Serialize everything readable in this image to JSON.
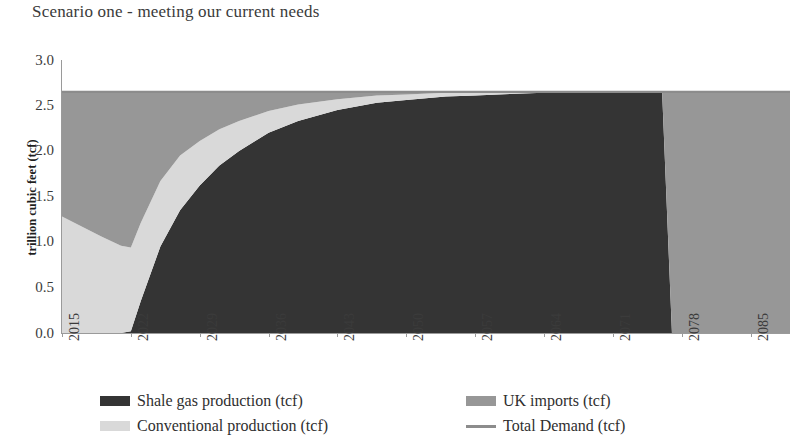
{
  "chart_data": {
    "type": "area",
    "title": "Scenario one - meeting our current needs",
    "xlabel": "",
    "ylabel": "trillion cubic feet (tcf)",
    "ylim": [
      0.0,
      3.0
    ],
    "xlim": [
      2015,
      2089
    ],
    "grid": false,
    "legend_position": "bottom",
    "stacked": true,
    "y_ticks": [
      "0.0",
      "0.5",
      "1.0",
      "1.5",
      "2.0",
      "2.5",
      "3.0"
    ],
    "y_tick_values": [
      0.0,
      0.5,
      1.0,
      1.5,
      2.0,
      2.5,
      3.0
    ],
    "x_ticks": [
      "2015",
      "2022",
      "2029",
      "2036",
      "2043",
      "2050",
      "2057",
      "2064",
      "2071",
      "2078",
      "2085"
    ],
    "x_tick_values": [
      2015,
      2022,
      2029,
      2036,
      2043,
      2050,
      2057,
      2064,
      2071,
      2078,
      2085
    ],
    "x": [
      2015,
      2017,
      2019,
      2021,
      2022,
      2023,
      2025,
      2027,
      2029,
      2031,
      2033,
      2036,
      2039,
      2043,
      2047,
      2050,
      2054,
      2057,
      2061,
      2064,
      2068,
      2071,
      2074,
      2076,
      2077,
      2080,
      2085,
      2089
    ],
    "series": [
      {
        "name": "Shale gas production (tcf)",
        "color": "#343434",
        "values": [
          0.0,
          0.0,
          0.0,
          0.0,
          0.02,
          0.35,
          0.95,
          1.35,
          1.62,
          1.84,
          2.0,
          2.2,
          2.33,
          2.45,
          2.53,
          2.56,
          2.6,
          2.61,
          2.63,
          2.64,
          2.65,
          2.65,
          2.65,
          2.65,
          0.0,
          0.0,
          0.0,
          0.0
        ]
      },
      {
        "name": "Conventional production (tcf)",
        "color": "#d9d9d9",
        "values": [
          1.28,
          1.17,
          1.06,
          0.96,
          0.92,
          0.86,
          0.72,
          0.6,
          0.49,
          0.4,
          0.33,
          0.24,
          0.18,
          0.12,
          0.08,
          0.06,
          0.04,
          0.03,
          0.02,
          0.01,
          0.0,
          0.0,
          0.0,
          0.0,
          0.0,
          0.0,
          0.0,
          0.0
        ]
      },
      {
        "name": "UK imports (tcf)",
        "color": "#979797",
        "values": [
          1.37,
          1.48,
          1.59,
          1.69,
          1.71,
          1.44,
          0.98,
          0.7,
          0.54,
          0.41,
          0.32,
          0.21,
          0.14,
          0.08,
          0.04,
          0.03,
          0.01,
          0.01,
          0.0,
          0.0,
          0.0,
          0.0,
          0.0,
          0.0,
          2.65,
          2.65,
          2.65,
          2.65
        ]
      },
      {
        "name": "Total Demand (tcf)",
        "color": "#8c8c8c",
        "type": "line",
        "values": [
          2.65,
          2.65,
          2.65,
          2.65,
          2.65,
          2.65,
          2.65,
          2.65,
          2.65,
          2.65,
          2.65,
          2.65,
          2.65,
          2.65,
          2.65,
          2.65,
          2.65,
          2.65,
          2.65,
          2.65,
          2.65,
          2.65,
          2.65,
          2.65,
          2.65,
          2.65,
          2.65,
          2.65
        ]
      }
    ],
    "annotations": []
  },
  "legend": {
    "items": [
      {
        "label": "Shale gas production (tcf)",
        "color": "#343434",
        "marker": "swatch"
      },
      {
        "label": "Conventional production (tcf)",
        "color": "#d9d9d9",
        "marker": "swatch"
      },
      {
        "label": "UK imports (tcf)",
        "color": "#979797",
        "marker": "swatch"
      },
      {
        "label": "Total Demand (tcf)",
        "color": "#8c8c8c",
        "marker": "line"
      }
    ]
  }
}
